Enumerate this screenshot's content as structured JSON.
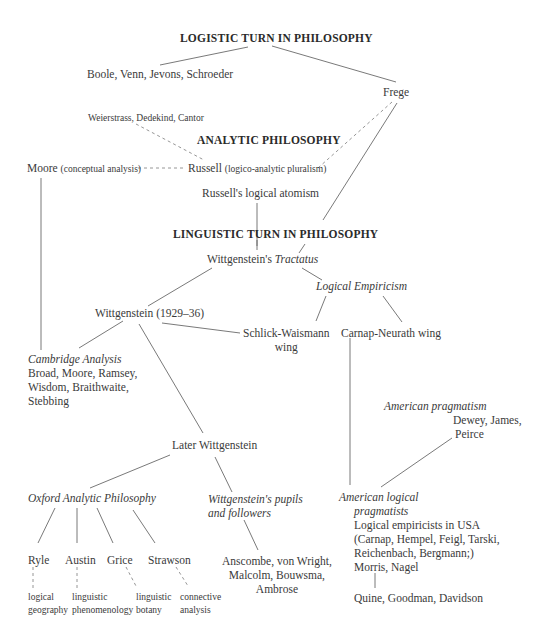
{
  "diagram": {
    "headings": {
      "logistic_turn": "LOGISTIC TURN IN PHILOSOPHY",
      "analytic": "ANALYTIC PHILOSOPHY",
      "linguistic_turn": "LINGUISTIC TURN IN PHILOSOPHY"
    },
    "nodes": {
      "boole": "Boole, Venn, Jevons, Schroeder",
      "frege": "Frege",
      "weierstrass": "Weierstrass, Dedekind, Cantor",
      "moore_name": "Moore",
      "moore_note": "(conceptual analysis)",
      "russell_name": "Russell",
      "russell_note": "(logico-analytic pluralism)",
      "russell_atomism": "Russell's logical atomism",
      "tractatus_prefix": "Wittgenstein's ",
      "tractatus_title": "Tractatus",
      "logical_empiricism": "Logical Empiricism",
      "wittgenstein_middle": "Wittgenstein (1929–36)",
      "schlick_line1": "Schlick-Waismann",
      "schlick_line2": "wing",
      "carnap_neurath": "Carnap-Neurath wing",
      "cambridge_title": "Cambridge Analysis",
      "cambridge_line1": "Broad, Moore, Ramsey,",
      "cambridge_line2": "Wisdom, Braithwaite,",
      "cambridge_line3": "Stebbing",
      "american_pragmatism_title": "American pragmatism",
      "american_pragmatism_line1": "Dewey, James,",
      "american_pragmatism_line2": "Peirce",
      "later_wittgenstein": "Later Wittgenstein",
      "oxford": "Oxford Analytic Philosophy",
      "pupils_line1": "Wittgenstein's pupils",
      "pupils_line2": "and followers",
      "alp_title_line1": "American logical",
      "alp_title_line2": "pragmatists",
      "alp_line1": "Logical empiricists in USA",
      "alp_line2": "(Carnap, Hempel, Feigl, Tarski,",
      "alp_line3": "Reichenbach, Bergmann;)",
      "alp_line4": "Morris, Nagel",
      "ryle": "Ryle",
      "austin": "Austin",
      "grice": "Grice",
      "strawson": "Strawson",
      "anscombe_line1": "Anscombe, von Wright,",
      "anscombe_line2": "Malcolm, Bouwsma,",
      "anscombe_line3": "Ambrose",
      "ryle_method_line1": "logical",
      "ryle_method_line2": "geography",
      "austin_method_line1": "linguistic",
      "austin_method_line2": "phenomenology",
      "grice_method_line1": "linguistic",
      "grice_method_line2": "botany",
      "strawson_method_line1": "connective",
      "strawson_method_line2": "analysis",
      "quine": "Quine, Goodman, Davidson"
    },
    "colors": {
      "text": "#3a3a3a",
      "heading": "#2a2a2a",
      "line": "#6a6a6a",
      "background": "#ffffff"
    }
  }
}
